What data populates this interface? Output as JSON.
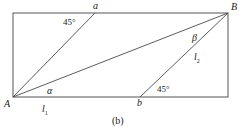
{
  "figure": {
    "caption": "(b)",
    "shape": "rectangle",
    "points": {
      "A": "A",
      "B": "B",
      "a": "a",
      "b": "b"
    },
    "angles": {
      "alpha": "α",
      "beta": "β",
      "top_left_45": "45°",
      "bottom_right_45": "45°"
    },
    "segments": {
      "l1_base": "l",
      "l1_sub": "1",
      "l2_base": "l",
      "l2_sub": "2"
    },
    "colors": {
      "stroke": "#4a4a4a",
      "text": "#1a1a1a",
      "background": "#ffffff"
    },
    "geometry": {
      "rect": {
        "x": 13,
        "y": 13,
        "width": 215,
        "height": 84
      },
      "vertex_A": {
        "x": 13,
        "y": 97
      },
      "vertex_B": {
        "x": 228,
        "y": 13
      },
      "point_a": {
        "x": 95,
        "y": 13
      },
      "point_b": {
        "x": 140,
        "y": 97
      }
    }
  }
}
